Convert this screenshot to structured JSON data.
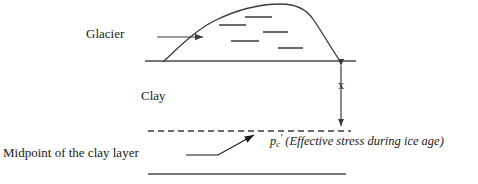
{
  "figure": {
    "type": "diagram",
    "background_color": "#ffffff",
    "line_color": "#3a3a3a",
    "text_color": "#1a1a1a"
  },
  "labels": {
    "glacier": "Glacier",
    "clay": "Clay",
    "depth": "x",
    "midpoint": "Midpoint of the clay layer",
    "stress_symbol": "p",
    "stress_subscript": "c",
    "stress_prime": "'",
    "stress_description": "(Effective stress during ice age)"
  },
  "geometry": {
    "ground_line": {
      "x1": 145,
      "y1": 61,
      "x2": 356,
      "y2": 61
    },
    "dashed_line": {
      "x1": 148,
      "y1": 131,
      "x2": 351,
      "y2": 131
    },
    "bottom_line": {
      "x1": 148,
      "y1": 174,
      "x2": 346,
      "y2": 174
    },
    "depth_arrow": {
      "x": 341,
      "y_top": 62,
      "y_bottom": 130
    },
    "glacier_flow_arrow": {
      "x1": 157,
      "y1": 37,
      "x2": 206,
      "y2": 37
    },
    "midpoint_leader": {
      "x1": 186,
      "y1": 155,
      "x2": 218,
      "y2": 155,
      "x3": 257,
      "y3": 133
    },
    "glacier_outline_path": "M 163 62 C 178 48 196 30 214 21 C 238 9 262 4 281 4 C 296 4 306 9 313 19 C 322 32 331 48 340 61",
    "ice_dashes": [
      {
        "x1": 245,
        "y1": 17,
        "x2": 272,
        "y2": 17
      },
      {
        "x1": 219,
        "y1": 25,
        "x2": 246,
        "y2": 25
      },
      {
        "x1": 263,
        "y1": 32,
        "x2": 288,
        "y2": 32
      },
      {
        "x1": 231,
        "y1": 41,
        "x2": 259,
        "y2": 41
      },
      {
        "x1": 278,
        "y1": 48,
        "x2": 303,
        "y2": 48
      }
    ]
  }
}
